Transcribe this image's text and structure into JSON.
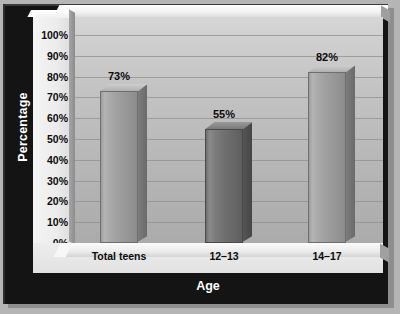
{
  "chart_data": {
    "type": "bar",
    "title": "",
    "xlabel": "Age",
    "ylabel": "Percentage",
    "categories": [
      "Total teens",
      "12–13",
      "14–17"
    ],
    "values": [
      73,
      55,
      82
    ],
    "value_labels": [
      "73%",
      "82%",
      "55%"
    ],
    "ylim": [
      0,
      100
    ],
    "ytick_labels": [
      "100%",
      "90%",
      "80%",
      "70%",
      "60%",
      "50%",
      "40%",
      "30%",
      "20%",
      "10%",
      "0%"
    ],
    "ytick_values": [
      100,
      90,
      80,
      70,
      60,
      50,
      40,
      30,
      20,
      10,
      0
    ],
    "grid": true,
    "legend": false,
    "series": [
      {
        "name": "Percentage",
        "points": [
          {
            "category": "Total teens",
            "value": 73,
            "label": "73%"
          },
          {
            "category": "12–13",
            "value": 55,
            "label": "55%"
          },
          {
            "category": "14–17",
            "value": 82,
            "label": "82%"
          }
        ]
      }
    ],
    "colors": {
      "bar_light": "#9c9c9c",
      "bar_dark": "#6e6e6e",
      "frame": "#141414",
      "plot_background": "#bdbdbd",
      "axis_panel": "#ececec",
      "gridline": "#8f8f8f",
      "label_text": "#0b0b0b",
      "title_text": "#ffffff"
    }
  }
}
